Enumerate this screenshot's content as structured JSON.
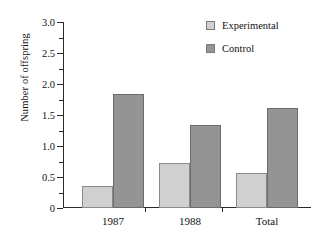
{
  "chart_data": {
    "type": "bar",
    "title": "",
    "xlabel": "",
    "ylabel": "Number of offspring",
    "categories": [
      "1987",
      "1988",
      "Total"
    ],
    "series": [
      {
        "name": "Experimental",
        "values": [
          0.35,
          0.73,
          0.57
        ],
        "color": "#d0d0d0"
      },
      {
        "name": "Control",
        "values": [
          1.84,
          1.34,
          1.62
        ],
        "color": "#949494"
      }
    ],
    "ylim": [
      0,
      3.0
    ],
    "ytick_labels": [
      "0",
      "0.5",
      "1.0",
      "1.5",
      "2.0",
      "2.5",
      "3.0"
    ],
    "ytick_values": [
      0,
      0.5,
      1.0,
      1.5,
      2.0,
      2.5,
      3.0
    ],
    "yminor_values": [
      0.25,
      0.75,
      1.25,
      1.75,
      2.25,
      2.75
    ],
    "grid": false,
    "legend_position": "top-right"
  },
  "legend": {
    "entries": [
      {
        "label": "Experimental",
        "color": "#d0d0d0"
      },
      {
        "label": "Control",
        "color": "#949494"
      }
    ]
  },
  "axes": {
    "y_title": "Number of offspring",
    "y_ticks": [
      {
        "label": "3.0",
        "value": 3.0
      },
      {
        "label": "2.5",
        "value": 2.5
      },
      {
        "label": "2.0",
        "value": 2.0
      },
      {
        "label": "1.5",
        "value": 1.5
      },
      {
        "label": "1.0",
        "value": 1.0
      },
      {
        "label": "0.5",
        "value": 0.5
      },
      {
        "label": "0",
        "value": 0
      }
    ],
    "x_ticks": [
      {
        "label": "1987"
      },
      {
        "label": "1988"
      },
      {
        "label": "Total"
      }
    ]
  }
}
